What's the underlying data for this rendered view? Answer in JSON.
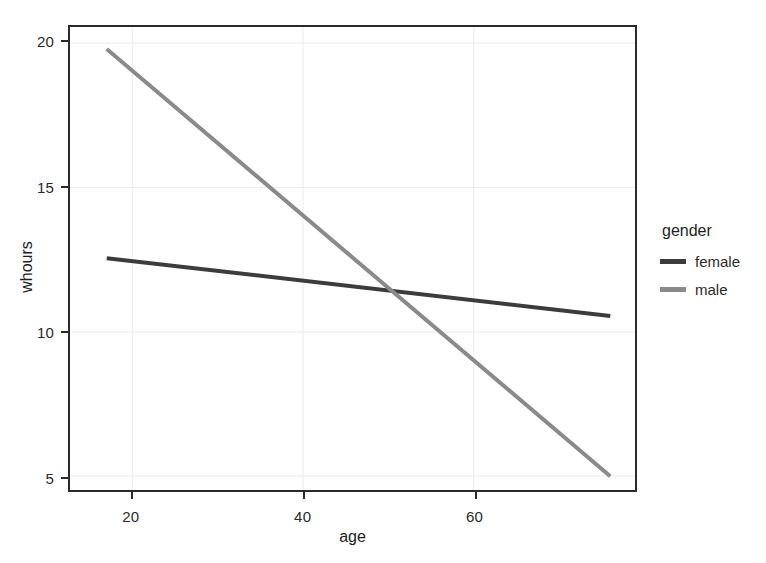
{
  "chart_data": {
    "type": "line",
    "title": "",
    "xlabel": "age",
    "ylabel": "whours",
    "xlim": [
      12.7,
      78.9
    ],
    "ylim": [
      4.52,
      20.56
    ],
    "xticks": [
      20,
      40,
      60
    ],
    "xtick_labels": [
      "20",
      "40",
      "60"
    ],
    "yticks": [
      5,
      10,
      15,
      20
    ],
    "ytick_labels": [
      "5",
      "10",
      "15",
      "20"
    ],
    "grid": true,
    "grid_color": "#eceff1",
    "legend": {
      "title": "gender",
      "position": "right",
      "entries": [
        {
          "name": "female",
          "color": "#3c3c3c"
        },
        {
          "name": "male",
          "color": "#8a8a8a"
        }
      ]
    },
    "series": [
      {
        "name": "female",
        "color": "#3c3c3c",
        "linewidth": 4,
        "x": [
          17,
          76
        ],
        "y": [
          12.55,
          10.55
        ]
      },
      {
        "name": "male",
        "color": "#8a8a8a",
        "linewidth": 4,
        "x": [
          17,
          76
        ],
        "y": [
          19.8,
          5.0
        ]
      }
    ],
    "annotations": [
      {
        "label": "lines-cross",
        "x": 50,
        "y": 11.45
      }
    ]
  },
  "axes": {
    "x_title": "age",
    "y_title": "whours"
  },
  "legend": {
    "title": "gender",
    "items": [
      {
        "label": "female"
      },
      {
        "label": "male"
      }
    ]
  }
}
